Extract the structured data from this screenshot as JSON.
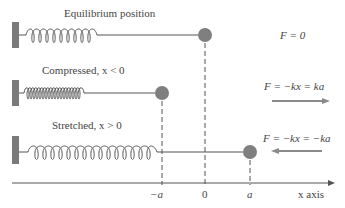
{
  "diagram": {
    "type": "spring-mass-hooke-law",
    "colors": {
      "wall": "#7a7a7a",
      "mass": "#7f7f7f",
      "line": "#555555",
      "arrow": "#8a8a8a",
      "text": "#444444"
    },
    "rows": [
      {
        "caption": "Equilibrium position",
        "force": "F = 0",
        "state": "equilibrium",
        "mass_position": "0"
      },
      {
        "caption": "Compressed, x < 0",
        "force": "F = −kx = ka",
        "state": "compressed",
        "mass_position": "−a",
        "arrow_direction": "right"
      },
      {
        "caption": "Stretched, x > 0",
        "force": "F = −kx = −ka",
        "state": "stretched",
        "mass_position": "a",
        "arrow_direction": "left"
      }
    ],
    "axis": {
      "label": "x axis",
      "ticks": [
        "−a",
        "0",
        "a"
      ]
    }
  }
}
